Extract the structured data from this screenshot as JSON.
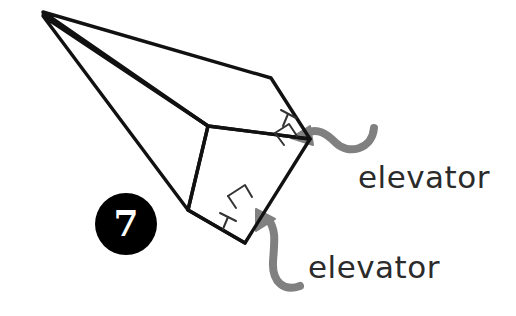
{
  "diagram": {
    "background_color": "#ffffff",
    "line_color": "#111111",
    "arrow_color": "#808080",
    "text_color": "#2b2b2b",
    "badge": {
      "number": "7",
      "shape": "circle",
      "fill_color": "#000000",
      "text_color": "#ffffff"
    },
    "labels": [
      {
        "id": "elevator-upper",
        "text": "elevator",
        "points_to": "upper-wing-trailing-edge-tab"
      },
      {
        "id": "elevator-lower",
        "text": "elevator",
        "points_to": "lower-wing-trailing-edge-tab"
      }
    ],
    "callout_arrows": [
      {
        "id": "arrow-upper",
        "style": "s-curve",
        "direction": "points-left",
        "color": "#808080"
      },
      {
        "id": "arrow-lower",
        "style": "hook-curve",
        "direction": "points-up-left",
        "color": "#808080"
      }
    ],
    "fold_marks": [
      {
        "id": "upper-tab-t-mark",
        "glyph": "T-mark"
      },
      {
        "id": "upper-tab-bracket-mark",
        "glyph": "square-bracket-mark"
      },
      {
        "id": "lower-tab-bracket-mark",
        "glyph": "square-bracket-mark"
      },
      {
        "id": "lower-tab-t-mark",
        "glyph": "T-mark"
      }
    ]
  }
}
